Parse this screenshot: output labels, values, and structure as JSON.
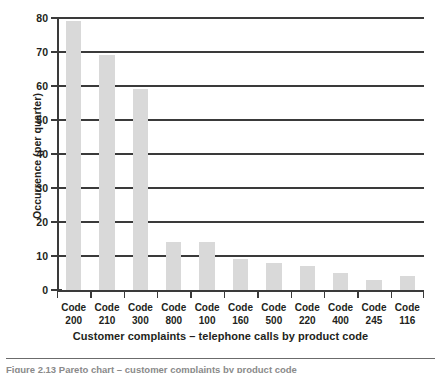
{
  "chart_data": {
    "type": "bar",
    "title": "",
    "xlabel": "Customer complaints – telephone calls by product code",
    "ylabel": "Occurrence (per quarter)",
    "categories": [
      "Code 200",
      "Code 210",
      "Code 300",
      "Code 800",
      "Code 100",
      "Code 160",
      "Code 500",
      "Code 220",
      "Code 400",
      "Code 245",
      "Code 116"
    ],
    "category_lines": [
      {
        "prefix": "Code",
        "code": "200"
      },
      {
        "prefix": "Code",
        "code": "210"
      },
      {
        "prefix": "Code",
        "code": "300"
      },
      {
        "prefix": "Code",
        "code": "800"
      },
      {
        "prefix": "Code",
        "code": "100"
      },
      {
        "prefix": "Code",
        "code": "160"
      },
      {
        "prefix": "Code",
        "code": "500"
      },
      {
        "prefix": "Code",
        "code": "220"
      },
      {
        "prefix": "Code",
        "code": "400"
      },
      {
        "prefix": "Code",
        "code": "245"
      },
      {
        "prefix": "Code",
        "code": "116"
      }
    ],
    "values": [
      79,
      69,
      59,
      14,
      14,
      9,
      8,
      7,
      5,
      3,
      4
    ],
    "ylim": [
      0,
      80
    ],
    "yticks": [
      0,
      10,
      20,
      30,
      40,
      50,
      60,
      70,
      80
    ],
    "ytick_labels": [
      "0",
      "10",
      "20",
      "30",
      "40",
      "50",
      "60",
      "70",
      "80"
    ],
    "grid": true,
    "grid_axis": "y",
    "legend": false,
    "bar_color": "#d9d9d9",
    "axis_color": "#3a3a3a"
  },
  "figure": {
    "caption": "Figure 2.13  Pareto chart – customer complaints by product code"
  }
}
